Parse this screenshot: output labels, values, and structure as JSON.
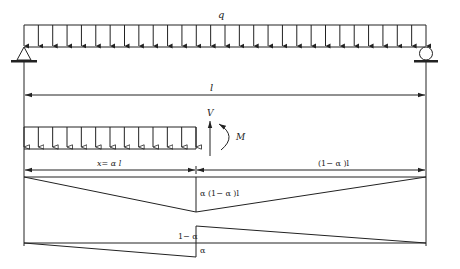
{
  "labels": {
    "load": "q",
    "span": "l",
    "shear_force": "V",
    "moment": "M",
    "left_segment": "x= α l",
    "right_segment": "(1− α )l",
    "moment_peak": "α (1− α )l",
    "shear_positive": "1− α",
    "shear_negative": "α"
  },
  "geometry": {
    "left_x": 24,
    "right_x": 426,
    "cut_x": 196,
    "alpha": 0.43
  },
  "colors": {
    "line": "#222222",
    "background": "#ffffff"
  }
}
